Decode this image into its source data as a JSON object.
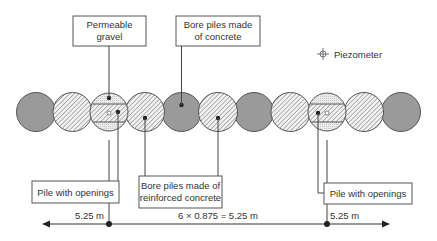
{
  "colors": {
    "concrete": "#9a9a9a",
    "outline": "#555555",
    "hatch": "#6e6e6e",
    "gravel_fill": "#e8e8e8",
    "text": "#333333",
    "background": "#ffffff"
  },
  "legend": {
    "icon": "piezometer-crosshair-icon",
    "label": "Piezometer"
  },
  "callouts": {
    "permeable_gravel": [
      "Permeable",
      "gravel"
    ],
    "bore_piles_concrete": [
      "Bore piles made",
      "of concrete"
    ],
    "pile_with_openings_left": "Pile with openings",
    "bore_piles_reinforced": [
      "Bore piles made of",
      "reinforced concrete"
    ],
    "pile_with_openings_right": "Pile with openings"
  },
  "piles": [
    {
      "index": 1,
      "type": "concrete"
    },
    {
      "index": 2,
      "type": "reinforced"
    },
    {
      "index": 3,
      "type": "pile-with-openings"
    },
    {
      "index": 4,
      "type": "reinforced"
    },
    {
      "index": 5,
      "type": "concrete"
    },
    {
      "index": 6,
      "type": "reinforced"
    },
    {
      "index": 7,
      "type": "concrete"
    },
    {
      "index": 8,
      "type": "reinforced"
    },
    {
      "index": 9,
      "type": "pile-with-openings"
    },
    {
      "index": 10,
      "type": "reinforced"
    },
    {
      "index": 11,
      "type": "concrete"
    }
  ],
  "dimensions": {
    "left": "5.25 m",
    "middle": "6 × 0.875 = 5.25 m",
    "right": "5.25 m"
  }
}
